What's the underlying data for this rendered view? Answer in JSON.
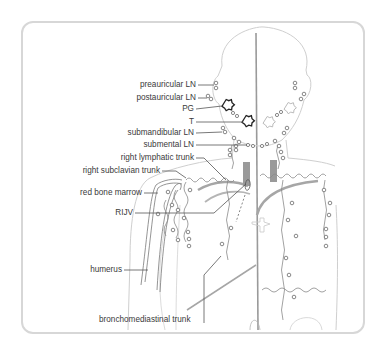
{
  "figure": {
    "type": "anatomical diagram",
    "colors": {
      "frame_border": "#d7d7d7",
      "body_outline": "#c8c8c8",
      "lymph_vessel": "#8a8a8a",
      "vein_fill": "#9a9a9a",
      "leader_line": "#555555",
      "text": "#3a3a3a"
    }
  },
  "labels": {
    "preauricular": "preauricular LN",
    "postauricular": "postauricular LN",
    "pg": "PG",
    "t": "T",
    "submandibular": "submandibular LN",
    "submental": "submental LN",
    "right_lymphatic_trunk": "right lymphatic trunk",
    "right_subclavian_trunk": "right subclavian trunk",
    "red_bone_marrow": "red bone marrow",
    "rijv": "RIJV",
    "humerus": "humerus",
    "bronchomediastinal_trunk": "bronchomediastinal trunk"
  },
  "icons": {
    "lymph_node": "small-circle",
    "gland": "star-outline"
  }
}
